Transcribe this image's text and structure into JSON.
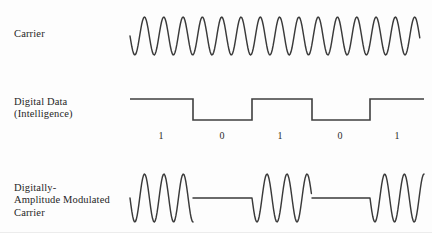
{
  "figure": {
    "background_color": "#fdfdfd",
    "line_color": "#3a3a3a",
    "text_color": "#262626"
  },
  "rows": [
    {
      "id": "carrier",
      "label": "Carrier",
      "label_lines": [
        "Carrier"
      ],
      "waveform": "continuous-sine"
    },
    {
      "id": "digital-data",
      "label": "Digital Data (Intelligence)",
      "label_lines": [
        "Digital Data",
        "(Intelligence)"
      ],
      "waveform": "square-nrz"
    },
    {
      "id": "am-carrier",
      "label": "Digitally-Amplitude Modulated Carrier",
      "label_lines": [
        "Digitally-",
        "Amplitude Modulated",
        "Carrier"
      ],
      "waveform": "ask-bursts"
    }
  ],
  "bits": [
    {
      "value": "1",
      "x": 161
    },
    {
      "value": "0",
      "x": 222
    },
    {
      "value": "1",
      "x": 280
    },
    {
      "value": "0",
      "x": 340
    },
    {
      "value": "1",
      "x": 397
    }
  ],
  "chart_data": {
    "type": "line",
    "xlabel": "",
    "ylabel": "",
    "series": [
      {
        "name": "Carrier",
        "description": "Continuous sinusoid, 15 cycles",
        "cycles": 15,
        "x_start": 130,
        "x_end": 420,
        "period_px": 19.3,
        "amplitude_px": 19,
        "baseline_y": 36
      },
      {
        "name": "Digital Data (Intelligence)",
        "description": "NRZ square wave, bit sequence 1 0 1 0 1",
        "bit_sequence": [
          1,
          0,
          1,
          0,
          1
        ],
        "transitions_x": [
          130,
          193,
          252,
          312,
          370,
          424
        ],
        "high_y": 99,
        "low_y": 120
      },
      {
        "name": "Digitally-Amplitude Modulated Carrier",
        "description": "ASK: carrier bursts during 1 bits, flat line during 0 bits",
        "bursts": [
          {
            "x_start": 130,
            "x_end": 193,
            "cycles": 3.25
          },
          {
            "x_start": 252,
            "x_end": 312,
            "cycles": 3
          },
          {
            "x_start": 370,
            "x_end": 424,
            "cycles": 2.75
          }
        ],
        "gaps": [
          {
            "x_start": 193,
            "x_end": 252
          },
          {
            "x_start": 312,
            "x_end": 370
          }
        ],
        "baseline_y": 198,
        "amplitude_px": 24
      }
    ],
    "grid": false,
    "legend": "none"
  }
}
